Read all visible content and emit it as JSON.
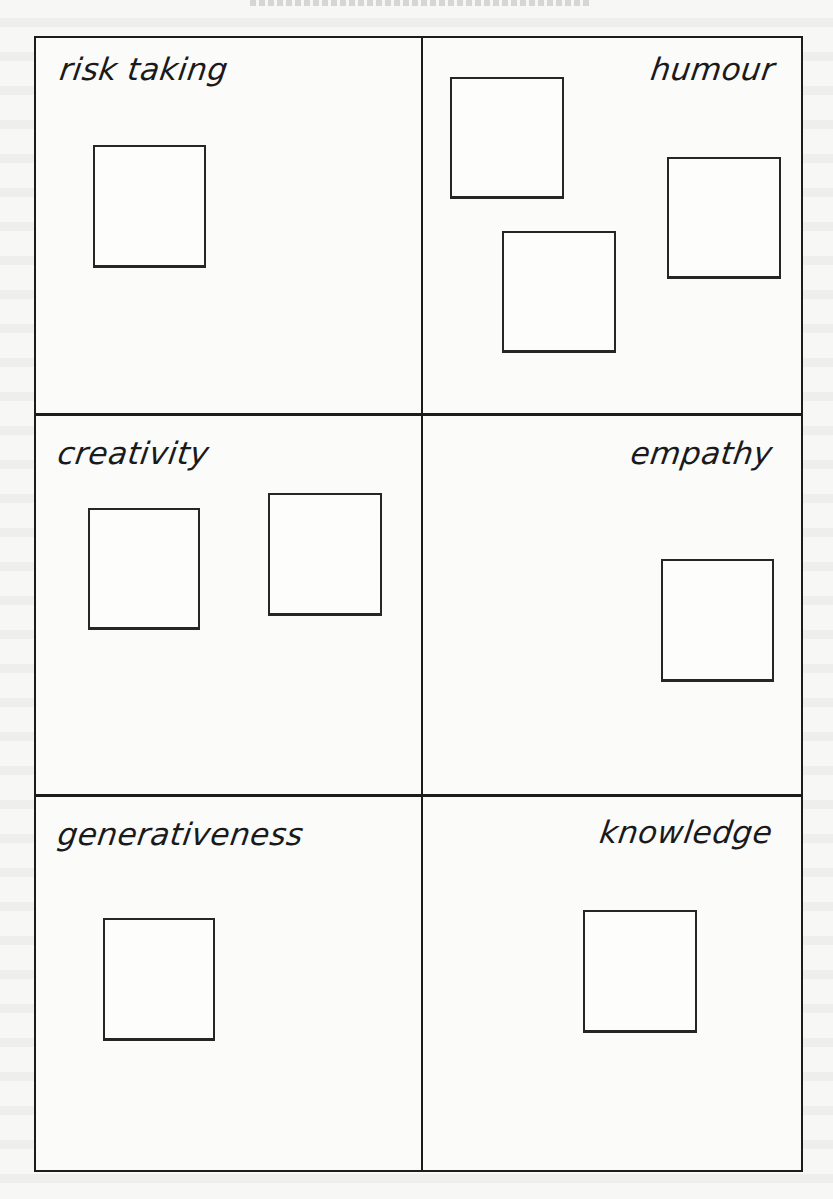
{
  "diagram": {
    "type": "four-by-two grid with handwritten category labels and empty square boxes",
    "quadrants": [
      {
        "id": "risk-taking",
        "label": "risk taking",
        "align": "left",
        "box_count": 1
      },
      {
        "id": "humour",
        "label": "humour",
        "align": "right",
        "box_count": 3
      },
      {
        "id": "creativity",
        "label": "creativity",
        "align": "left",
        "box_count": 2
      },
      {
        "id": "empathy",
        "label": "empathy",
        "align": "right",
        "box_count": 1
      },
      {
        "id": "generativeness",
        "label": "generativeness",
        "align": "left",
        "box_count": 1
      },
      {
        "id": "knowledge",
        "label": "knowledge",
        "align": "right",
        "box_count": 1
      }
    ],
    "colors": {
      "ink": "#1c1c1c",
      "paper": "#f7f7f5"
    }
  }
}
